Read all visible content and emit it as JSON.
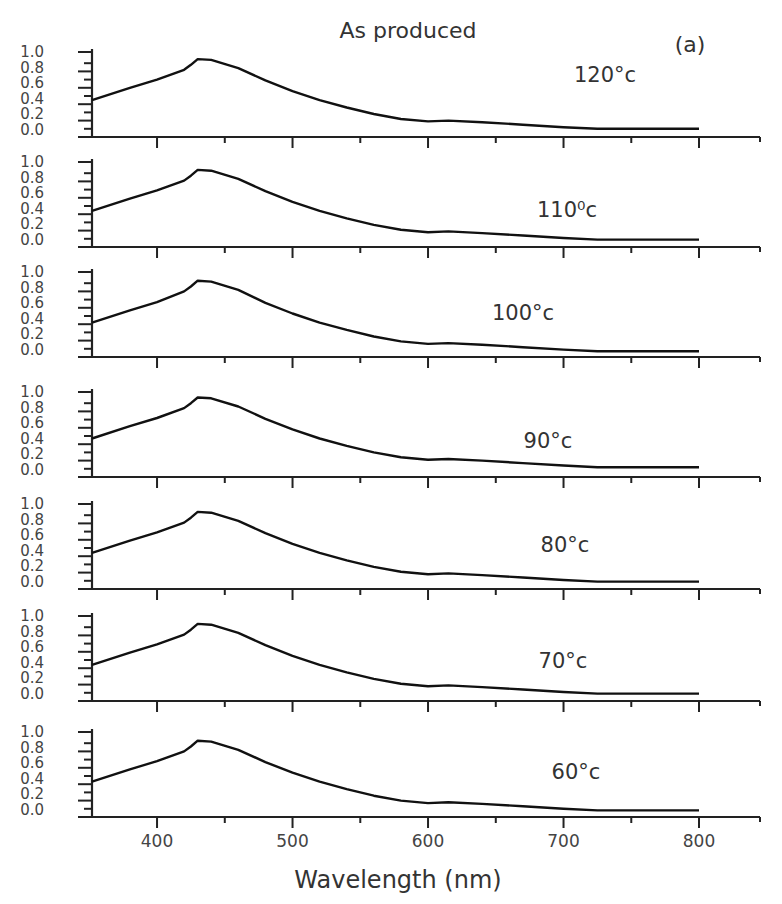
{
  "chart_data": {
    "type": "line",
    "title": "As produced",
    "panel_tag": "(a)",
    "xlabel": "Wavelength (nm)",
    "ylabel": "",
    "xlim": [
      352,
      845
    ],
    "ylim": [
      0.0,
      1.0
    ],
    "x_ticks": [
      400,
      500,
      600,
      700,
      800
    ],
    "x_tick_labels": [
      "400",
      "500",
      "600",
      "700",
      "800"
    ],
    "x_minor_ticks": [
      450,
      550,
      650,
      750
    ],
    "y_tick_labels": [
      "1.0",
      "0.8",
      "0.6",
      "0.4",
      "0.2",
      "0.0"
    ],
    "y_tick_values": [
      1.0,
      0.8,
      0.6,
      0.4,
      0.2,
      0.0
    ],
    "grid": false,
    "legend": "none",
    "panels": [
      {
        "label": "120°c",
        "x": [
          352,
          380,
          400,
          420,
          425,
          430,
          440,
          460,
          480,
          500,
          520,
          540,
          560,
          580,
          600,
          615,
          640,
          670,
          700,
          725,
          760,
          800
        ],
        "y": [
          0.45,
          0.6,
          0.7,
          0.82,
          0.88,
          0.95,
          0.94,
          0.84,
          0.69,
          0.56,
          0.45,
          0.36,
          0.28,
          0.22,
          0.19,
          0.2,
          0.18,
          0.15,
          0.12,
          0.1,
          0.1,
          0.1
        ]
      },
      {
        "label": "110⁰c",
        "x": [
          352,
          380,
          400,
          420,
          425,
          430,
          440,
          460,
          480,
          500,
          520,
          540,
          560,
          580,
          600,
          615,
          640,
          670,
          700,
          725,
          760,
          800
        ],
        "y": [
          0.44,
          0.59,
          0.69,
          0.81,
          0.87,
          0.94,
          0.93,
          0.83,
          0.68,
          0.55,
          0.44,
          0.35,
          0.27,
          0.21,
          0.18,
          0.19,
          0.17,
          0.14,
          0.11,
          0.09,
          0.09,
          0.09
        ]
      },
      {
        "label": "100°c",
        "x": [
          352,
          380,
          400,
          420,
          425,
          430,
          440,
          460,
          480,
          500,
          520,
          540,
          560,
          580,
          600,
          615,
          640,
          670,
          700,
          725,
          760,
          800
        ],
        "y": [
          0.42,
          0.57,
          0.67,
          0.8,
          0.86,
          0.93,
          0.92,
          0.82,
          0.66,
          0.53,
          0.42,
          0.33,
          0.25,
          0.19,
          0.16,
          0.17,
          0.15,
          0.12,
          0.09,
          0.07,
          0.07,
          0.07
        ]
      },
      {
        "label": "90°c",
        "x": [
          352,
          380,
          400,
          420,
          425,
          430,
          440,
          460,
          480,
          500,
          520,
          540,
          560,
          580,
          600,
          615,
          640,
          670,
          700,
          725,
          760,
          800
        ],
        "y": [
          0.47,
          0.62,
          0.72,
          0.84,
          0.9,
          0.97,
          0.96,
          0.86,
          0.71,
          0.58,
          0.47,
          0.38,
          0.3,
          0.24,
          0.21,
          0.22,
          0.2,
          0.17,
          0.14,
          0.12,
          0.12,
          0.12
        ]
      },
      {
        "label": "80°c",
        "x": [
          352,
          380,
          400,
          420,
          425,
          430,
          440,
          460,
          480,
          500,
          520,
          540,
          560,
          580,
          600,
          615,
          640,
          670,
          700,
          725,
          760,
          800
        ],
        "y": [
          0.44,
          0.59,
          0.69,
          0.81,
          0.87,
          0.94,
          0.93,
          0.83,
          0.68,
          0.55,
          0.44,
          0.35,
          0.27,
          0.21,
          0.18,
          0.19,
          0.17,
          0.14,
          0.11,
          0.09,
          0.09,
          0.09
        ]
      },
      {
        "label": "70°c",
        "x": [
          352,
          380,
          400,
          420,
          425,
          430,
          440,
          460,
          480,
          500,
          520,
          540,
          560,
          580,
          600,
          615,
          640,
          670,
          700,
          725,
          760,
          800
        ],
        "y": [
          0.44,
          0.59,
          0.69,
          0.81,
          0.87,
          0.94,
          0.93,
          0.83,
          0.68,
          0.55,
          0.44,
          0.35,
          0.27,
          0.21,
          0.18,
          0.19,
          0.17,
          0.14,
          0.11,
          0.09,
          0.09,
          0.09
        ]
      },
      {
        "label": "60°c",
        "x": [
          352,
          380,
          400,
          420,
          425,
          430,
          440,
          460,
          480,
          500,
          520,
          540,
          560,
          580,
          600,
          615,
          640,
          670,
          700,
          725,
          760,
          800
        ],
        "y": [
          0.43,
          0.58,
          0.68,
          0.8,
          0.86,
          0.93,
          0.92,
          0.82,
          0.67,
          0.54,
          0.43,
          0.34,
          0.26,
          0.2,
          0.17,
          0.18,
          0.16,
          0.13,
          0.1,
          0.08,
          0.08,
          0.08
        ]
      }
    ]
  }
}
